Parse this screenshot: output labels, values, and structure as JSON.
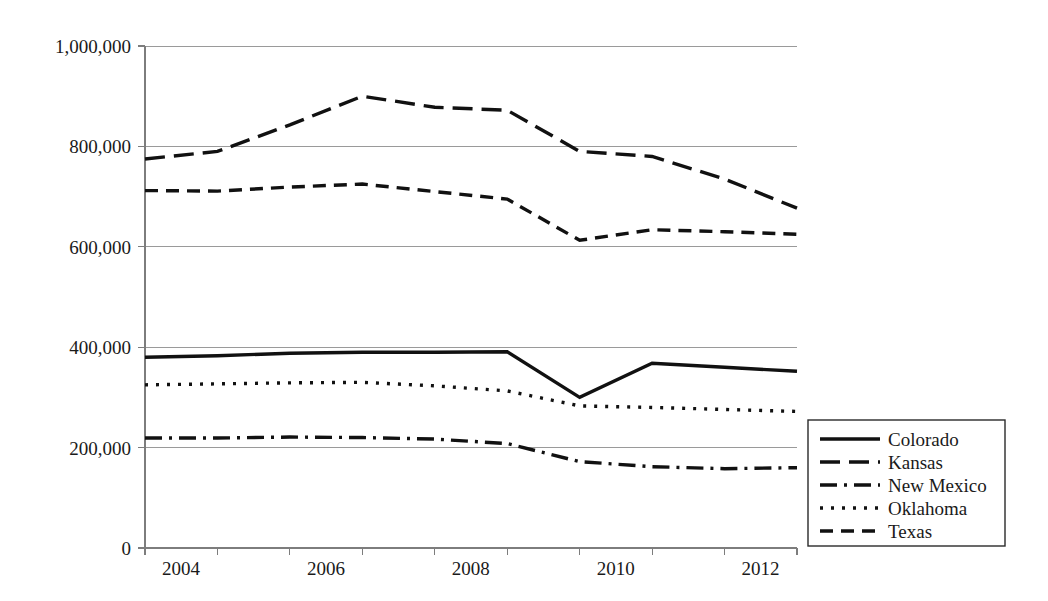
{
  "chart_data": {
    "type": "line",
    "title": "",
    "subtitle": "",
    "xlabel": "",
    "ylabel": "",
    "x": [
      2004,
      2005,
      2006,
      2007,
      2008,
      2009,
      2010,
      2011,
      2012,
      2013
    ],
    "xtick_labels": [
      "2004",
      "",
      "2006",
      "",
      "2008",
      "",
      "2010",
      "",
      "2012",
      ""
    ],
    "xtick_labels_shown": [
      "2004",
      "2006",
      "2008",
      "2010",
      "2012"
    ],
    "ytick_labels": [
      "0",
      "200,000",
      "400,000",
      "600,000",
      "800,000",
      "1,000,000"
    ],
    "ytick_values": [
      0,
      200000,
      400000,
      600000,
      800000,
      1000000
    ],
    "ylim": [
      0,
      1000000
    ],
    "xlim": [
      2004,
      2013
    ],
    "grid": "horizontal",
    "legend_position": "right-bottom-outside",
    "series": [
      {
        "name": "Colorado",
        "dash": "solid",
        "dash_pattern": "none",
        "values": [
          380000,
          383000,
          388000,
          390000,
          390000,
          391000,
          300000,
          368000,
          360000,
          352000
        ]
      },
      {
        "name": "Kansas",
        "dash": "long-dash",
        "dash_pattern": "20 9",
        "values": [
          775000,
          790000,
          843000,
          900000,
          878000,
          872000,
          790000,
          780000,
          735000,
          677000
        ]
      },
      {
        "name": "New Mexico",
        "dash": "dash-dot",
        "dash_pattern": "17 7 3 7",
        "values": [
          219000,
          219000,
          221000,
          220000,
          217000,
          208000,
          172000,
          162000,
          158000,
          160000
        ]
      },
      {
        "name": "Oklahoma",
        "dash": "dotted",
        "dash_pattern": "3 8",
        "values": [
          325000,
          327000,
          329000,
          330000,
          323000,
          313000,
          283000,
          280000,
          276000,
          272000
        ]
      },
      {
        "name": "Texas",
        "dash": "dashed",
        "dash_pattern": "13 8",
        "values": [
          712000,
          711000,
          719000,
          725000,
          710000,
          695000,
          613000,
          634000,
          630000,
          625000
        ]
      }
    ]
  },
  "colors": {
    "series_stroke": "#111111",
    "gridline": "#9a9a9a",
    "axis": "#7d7d7d",
    "text": "#1a1a1a",
    "background": "#ffffff",
    "legend_border": "#2a2a2a"
  },
  "legend": {
    "entries": [
      {
        "label": "Colorado",
        "dash_pattern": "none"
      },
      {
        "label": "Kansas",
        "dash_pattern": "20 9"
      },
      {
        "label": "New Mexico",
        "dash_pattern": "17 7 3 7"
      },
      {
        "label": "Oklahoma",
        "dash_pattern": "3 8"
      },
      {
        "label": "Texas",
        "dash_pattern": "13 8"
      }
    ]
  }
}
